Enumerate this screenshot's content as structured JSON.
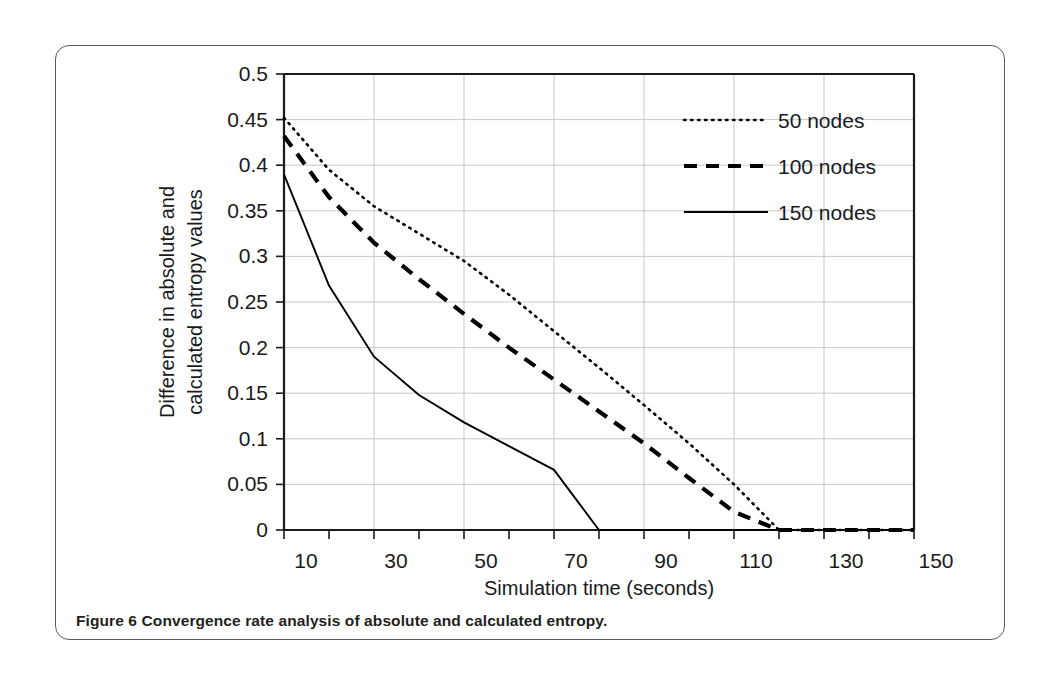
{
  "figure": {
    "caption_label": "Figure 6",
    "caption_text": "Convergence rate analysis of absolute and calculated entropy."
  },
  "chart_data": {
    "type": "line",
    "title": "",
    "xlabel": "Simulation time (seconds)",
    "ylabel": "Difference in absolute and calculated entropy values",
    "ylabel_line1": "Difference in absolute and",
    "ylabel_line2": "calculated entropy values",
    "xlim": [
      10,
      150
    ],
    "ylim": [
      0,
      0.5
    ],
    "grid": true,
    "legend_position": "top-right",
    "x_tick_labels": [
      "10",
      "30",
      "50",
      "70",
      "90",
      "110",
      "130",
      "150"
    ],
    "x_tick_values": [
      10,
      30,
      50,
      70,
      90,
      110,
      130,
      150
    ],
    "y_tick_labels": [
      "0",
      "0.05",
      "0.1",
      "0.15",
      "0.2",
      "0.25",
      "0.3",
      "0.35",
      "0.4",
      "0.45",
      "0.5"
    ],
    "y_tick_values": [
      0,
      0.05,
      0.1,
      0.15,
      0.2,
      0.25,
      0.3,
      0.35,
      0.4,
      0.45,
      0.5
    ],
    "x": [
      10,
      20,
      30,
      40,
      50,
      60,
      70,
      80,
      90,
      100,
      110,
      120,
      130,
      140,
      150
    ],
    "series": [
      {
        "name": "50 nodes",
        "style": "dotted",
        "color": "#000000",
        "values": [
          0.452,
          0.395,
          0.355,
          0.325,
          0.295,
          0.258,
          0.218,
          0.178,
          0.137,
          0.095,
          0.05,
          0.0,
          0.0,
          0.0,
          0.0
        ]
      },
      {
        "name": "100 nodes",
        "style": "dashed",
        "color": "#000000",
        "values": [
          0.432,
          0.365,
          0.315,
          0.275,
          0.237,
          0.2,
          0.165,
          0.13,
          0.095,
          0.057,
          0.02,
          0.0,
          0.0,
          0.0,
          0.0
        ]
      },
      {
        "name": "150 nodes",
        "style": "solid",
        "color": "#000000",
        "values": [
          0.39,
          0.268,
          0.19,
          0.148,
          0.118,
          0.092,
          0.066,
          0.0,
          0.0,
          0.0,
          0.0,
          0.0,
          0.0,
          0.0,
          0.0
        ]
      }
    ],
    "legend": [
      {
        "label": "50 nodes",
        "style": "dotted"
      },
      {
        "label": "100 nodes",
        "style": "dashed"
      },
      {
        "label": "150 nodes",
        "style": "solid"
      }
    ]
  }
}
